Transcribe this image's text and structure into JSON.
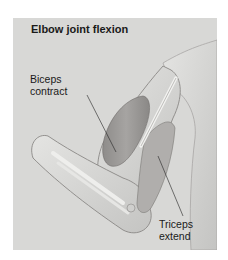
{
  "figure": {
    "title": "Elbow joint flexion",
    "labels": {
      "biceps": [
        "Biceps",
        "contract"
      ],
      "triceps": [
        "Triceps",
        "extend"
      ]
    },
    "colors": {
      "background": "#d8d8d6",
      "muscle": "#9c9a98",
      "skin_outline": "#8a8886",
      "leader_line": "#222222"
    }
  }
}
